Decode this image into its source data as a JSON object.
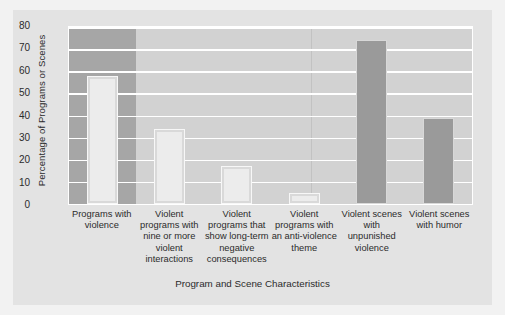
{
  "chart_data": {
    "type": "bar",
    "title": "",
    "xlabel": "Program and Scene Characteristics",
    "ylabel": "Percentage of Programs or Scenes",
    "categories": [
      "Programs with violence",
      "Violent programs with nine or more violent interactions",
      "Violent programs that show long-term negative consequences",
      "Violent programs with an anti-violence theme",
      "Violent scenes with unpunished violence",
      "Violent scenes with humor"
    ],
    "values": [
      58,
      34,
      17,
      5,
      74,
      39
    ],
    "ylim": [
      0,
      80
    ],
    "yticks": [
      0,
      10,
      20,
      30,
      40,
      50,
      60,
      70,
      80
    ],
    "ytick_labels": [
      "0",
      "10",
      "20",
      "30",
      "40",
      "50",
      "60",
      "70",
      "80"
    ],
    "grid": true,
    "legend": "none",
    "bar_styles": [
      "light",
      "light",
      "light",
      "light",
      "dark",
      "dark"
    ],
    "colors": {
      "figure_background": "#e3e3e3",
      "plot_background": "#d2d2d2",
      "highlight_band": "#a6a6a6",
      "gridline": "#ffffff",
      "bar_light": "#ececec",
      "bar_dark": "#9a9a9a",
      "text": "#2b2b2b",
      "page_background": "#f2f2f2"
    }
  },
  "axis": {
    "y_title": "Percentage of Programs or Scenes",
    "x_title": "Program and Scene Characteristics"
  }
}
